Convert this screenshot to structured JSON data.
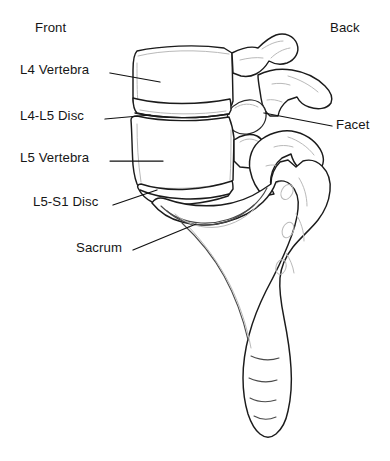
{
  "figure": {
    "background_color": "#ffffff",
    "line_color": "#1b1b1b",
    "inner_line_color": "#b9b9b9"
  },
  "orientation_labels": {
    "front": "Front",
    "back": "Back"
  },
  "annotations": [
    {
      "key": "l4_vertebra",
      "label": "L4 Vertebra",
      "side": "left",
      "leader_from": [
        110,
        73
      ],
      "leader_to": [
        160,
        82
      ]
    },
    {
      "key": "l4_l5_disc",
      "label": "L4-L5 Disc",
      "side": "left",
      "leader_from": [
        105,
        119
      ],
      "leader_to": [
        150,
        115
      ]
    },
    {
      "key": "l5_vertebra",
      "label": "L5 Vertebra",
      "side": "left",
      "leader_from": [
        110,
        161
      ],
      "leader_to": [
        163,
        161
      ]
    },
    {
      "key": "l5_s1_disc",
      "label": "L5-S1 Disc",
      "side": "left",
      "leader_from": [
        113,
        205
      ],
      "leader_to": [
        157,
        190
      ]
    },
    {
      "key": "sacrum",
      "label": "Sacrum",
      "side": "left",
      "leader_from": [
        133,
        250
      ],
      "leader_to": [
        196,
        224
      ]
    },
    {
      "key": "facet",
      "label": "Facet",
      "side": "right",
      "leader_from": [
        332,
        126
      ],
      "leader_to": [
        264,
        113
      ]
    }
  ],
  "anatomy_parts": [
    "L4 vertebral body",
    "L4 spinous process",
    "L4-L5 intervertebral disc",
    "L5 vertebral body",
    "L5 spinous process",
    "facet joint",
    "L5-S1 intervertebral disc",
    "sacrum",
    "coccyx"
  ]
}
